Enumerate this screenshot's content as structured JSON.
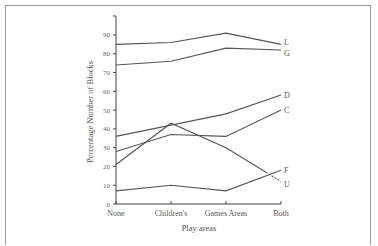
{
  "chart_data": {
    "type": "line",
    "title": "",
    "xlabel": "Play areas",
    "ylabel": "Percentage Number of Blocks",
    "categories": [
      "None",
      "Children's",
      "Games Areas",
      "Both"
    ],
    "yticks": [
      0,
      10,
      20,
      30,
      40,
      50,
      60,
      70,
      80,
      90
    ],
    "ylim": [
      0,
      100
    ],
    "grid": false,
    "legend_position": "inline-right",
    "series": [
      {
        "name": "L",
        "values": [
          85,
          86,
          91,
          85
        ],
        "style": "solid"
      },
      {
        "name": "G",
        "values": [
          74,
          76,
          83,
          82
        ],
        "style": "solid"
      },
      {
        "name": "D",
        "values": [
          36,
          42,
          48,
          58
        ],
        "style": "solid"
      },
      {
        "name": "C",
        "values": [
          28,
          37,
          36,
          50
        ],
        "style": "solid"
      },
      {
        "name": "F",
        "values": [
          7,
          10,
          7,
          18
        ],
        "style": "solid"
      },
      {
        "name": "U",
        "values": [
          21,
          43,
          30,
          12
        ],
        "style": "solid-then-dashed"
      }
    ]
  },
  "labels": {
    "ylabel": "Percentage Number of Blocks",
    "xlabel": "Play areas"
  }
}
